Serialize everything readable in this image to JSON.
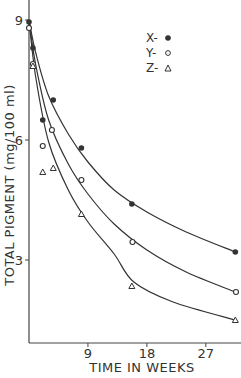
{
  "chart_data": {
    "type": "line",
    "title": "",
    "xlabel": "TIME IN WEEKS",
    "ylabel": "TOTAL PIGMENT (mg/100 ml)",
    "xlim": [
      0,
      32
    ],
    "ylim": [
      0.9,
      9.5
    ],
    "x_ticks": [
      9,
      18,
      27
    ],
    "y_ticks": [
      3,
      6,
      9
    ],
    "grid": false,
    "legend_position": "upper right (inside)",
    "series": [
      {
        "name": "X",
        "marker": "filled-circle",
        "x": [
          0,
          0.6,
          2.1,
          3.7,
          8,
          15.7,
          31.5
        ],
        "y": [
          8.95,
          8.3,
          6.5,
          7.0,
          5.8,
          4.4,
          3.2
        ]
      },
      {
        "name": "Y",
        "marker": "open-circle",
        "x": [
          0,
          0.6,
          2.1,
          3.5,
          8,
          15.8,
          31.6
        ],
        "y": [
          8.8,
          7.9,
          5.85,
          6.25,
          5.0,
          3.45,
          2.2
        ]
      },
      {
        "name": "Z",
        "marker": "triangle",
        "x": [
          0.6,
          2.1,
          3.7,
          8,
          15.7,
          31.5
        ],
        "y": [
          7.85,
          5.2,
          5.3,
          4.15,
          2.35,
          1.5
        ]
      }
    ],
    "fit_curves": {
      "X": [
        [
          0,
          9.0
        ],
        [
          1,
          8.2
        ],
        [
          3,
          7.1
        ],
        [
          6,
          6.15
        ],
        [
          9,
          5.45
        ],
        [
          13,
          4.75
        ],
        [
          18,
          4.2
        ],
        [
          24,
          3.7
        ],
        [
          31.5,
          3.2
        ]
      ],
      "Y": [
        [
          0,
          9.0
        ],
        [
          1,
          7.9
        ],
        [
          3,
          6.5
        ],
        [
          6,
          5.4
        ],
        [
          9,
          4.65
        ],
        [
          13,
          3.9
        ],
        [
          18,
          3.25
        ],
        [
          24,
          2.7
        ],
        [
          31.5,
          2.2
        ]
      ],
      "Z": [
        [
          0,
          9.0
        ],
        [
          1,
          7.6
        ],
        [
          3,
          5.95
        ],
        [
          6,
          4.75
        ],
        [
          9,
          3.95
        ],
        [
          13,
          3.15
        ],
        [
          16,
          2.45
        ],
        [
          22,
          1.95
        ],
        [
          31.5,
          1.5
        ]
      ]
    }
  },
  "legend": {
    "items": [
      {
        "label": "X-",
        "marker": "filled-circle"
      },
      {
        "label": "Y-",
        "marker": "open-circle"
      },
      {
        "label": "Z-",
        "marker": "triangle"
      }
    ]
  },
  "axes": {
    "x_tick_labels": [
      "9",
      "18",
      "27"
    ],
    "y_tick_labels": [
      "9",
      "6",
      "3"
    ],
    "x_title": "TIME IN WEEKS",
    "y_title": "TOTAL PIGMENT (mg/100 ml)"
  },
  "colors": {
    "ink": "#333333",
    "background": "#ffffff"
  }
}
